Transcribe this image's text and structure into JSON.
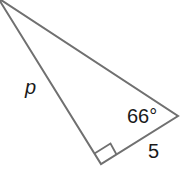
{
  "diagram": {
    "type": "right-triangle",
    "stroke_color": "#707070",
    "text_color": "#1a1a1a",
    "labels": {
      "hypotenuse_side": "p",
      "angle": "66°",
      "short_leg": "5"
    },
    "right_angle_marker": true
  }
}
